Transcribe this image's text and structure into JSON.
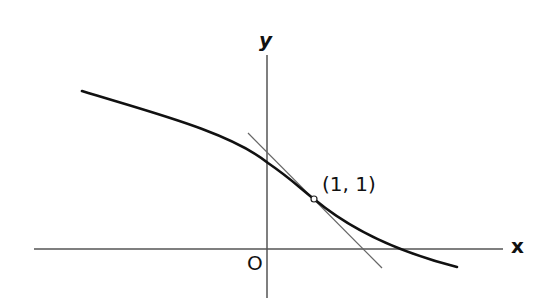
{
  "diagram": {
    "title": "",
    "axes": {
      "x_label": "x",
      "y_label": "y",
      "origin_label": "O"
    },
    "point": {
      "label": "(1, 1)",
      "x": 1,
      "y": 1
    },
    "elements": [
      {
        "type": "axis",
        "name": "x-axis"
      },
      {
        "type": "axis",
        "name": "y-axis"
      },
      {
        "type": "curve",
        "name": "decreasing-curve",
        "description": "smooth decreasing curve passing through (1, 1), concave down left of the point and concave up to the right (inflection near the point)"
      },
      {
        "type": "line",
        "name": "tangent-line",
        "description": "tangent line to the curve at (1, 1)"
      },
      {
        "type": "point",
        "name": "tangent-point",
        "description": "open circle marking (1, 1)"
      }
    ],
    "colors": {
      "curve": "#111111",
      "axes": "#555555",
      "tangent": "#666666",
      "background": "#ffffff"
    }
  }
}
